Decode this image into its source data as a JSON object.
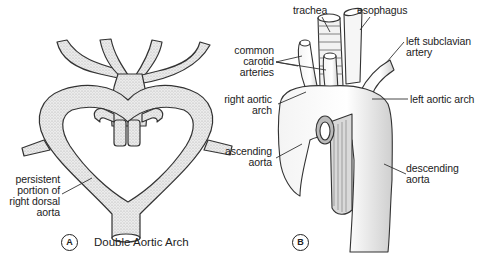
{
  "figure": {
    "panel_a": {
      "tag": "A",
      "caption": "Double Aortic Arch",
      "labels": {
        "persistent_dorsal_aorta": [
          "persistent",
          "portion of",
          "right dorsal",
          "aorta"
        ]
      }
    },
    "panel_b": {
      "tag": "B",
      "labels": {
        "trachea": "trachea",
        "esophagus": "esophagus",
        "common_carotid": [
          "common",
          "carotid",
          "arteries"
        ],
        "left_subclavian": [
          "left subclavian",
          "artery"
        ],
        "right_aortic_arch": [
          "right aortic",
          "arch"
        ],
        "left_aortic_arch": "left aortic arch",
        "ascending_aorta": [
          "ascending",
          "aorta"
        ],
        "descending_aorta": [
          "descending",
          "aorta"
        ]
      }
    },
    "colors": {
      "vessel_fill": "#e6e6e6",
      "outline": "#333333",
      "text": "#222222"
    }
  }
}
